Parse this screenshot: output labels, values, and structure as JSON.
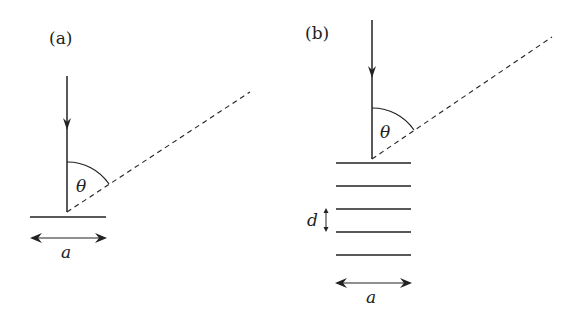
{
  "panels": [
    {
      "label": "(a)",
      "angle_symbol": "θ",
      "width_symbol": "a",
      "description": "Single scattering layer with incident vertical beam and scattered dashed ray at angle θ"
    },
    {
      "label": "(b)",
      "angle_symbol": "θ",
      "width_symbol": "a",
      "spacing_symbol": "d",
      "layers": 5,
      "description": "Stack of parallel layers spaced by d with incident vertical beam and scattered dashed ray at angle θ"
    }
  ],
  "colors": {
    "line": "#222222",
    "background": "#ffffff"
  }
}
